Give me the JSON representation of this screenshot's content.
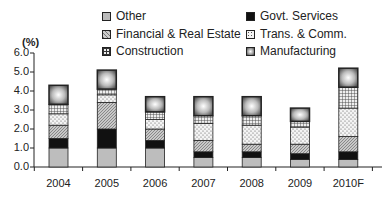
{
  "chart_data": {
    "type": "bar",
    "stacked": true,
    "title": "",
    "xlabel": "",
    "ylabel": "(%)",
    "ylim": [
      0,
      6.0
    ],
    "yticks": [
      "0.0",
      "1.0",
      "2.0",
      "3.0",
      "4.0",
      "5.0",
      "6.0"
    ],
    "categories": [
      "2004",
      "2005",
      "2006",
      "2007",
      "2008",
      "2009",
      "2010F"
    ],
    "series": [
      {
        "name": "Other",
        "values": [
          1.0,
          1.0,
          1.0,
          0.5,
          0.5,
          0.4,
          0.4
        ],
        "pattern": "gray"
      },
      {
        "name": "Govt. Services",
        "values": [
          0.5,
          1.0,
          0.4,
          0.3,
          0.3,
          0.3,
          0.4
        ],
        "pattern": "black"
      },
      {
        "name": "Financial & Real Estate",
        "values": [
          0.7,
          1.4,
          0.6,
          0.6,
          0.4,
          0.5,
          0.8
        ],
        "pattern": "hatch"
      },
      {
        "name": "Trans. & Comm.",
        "values": [
          0.6,
          0.4,
          0.5,
          0.9,
          1.0,
          0.9,
          1.5
        ],
        "pattern": "dots"
      },
      {
        "name": "Construction",
        "values": [
          0.5,
          0.3,
          0.4,
          0.4,
          0.5,
          0.3,
          1.1
        ],
        "pattern": "grid"
      },
      {
        "name": "Manufacturing",
        "values": [
          1.0,
          1.0,
          0.8,
          1.0,
          1.0,
          0.7,
          1.0
        ],
        "pattern": "bevel"
      }
    ],
    "totals": [
      4.3,
      5.1,
      3.7,
      3.7,
      3.7,
      3.1,
      5.2
    ],
    "legend_position": "top",
    "grid": false
  },
  "legend": {
    "items": [
      {
        "label": "Other"
      },
      {
        "label": "Govt. Services"
      },
      {
        "label": "Financial & Real Estate"
      },
      {
        "label": "Trans. & Comm."
      },
      {
        "label": "Construction"
      },
      {
        "label": "Manufacturing"
      }
    ]
  },
  "axis": {
    "unit": "(%)"
  }
}
